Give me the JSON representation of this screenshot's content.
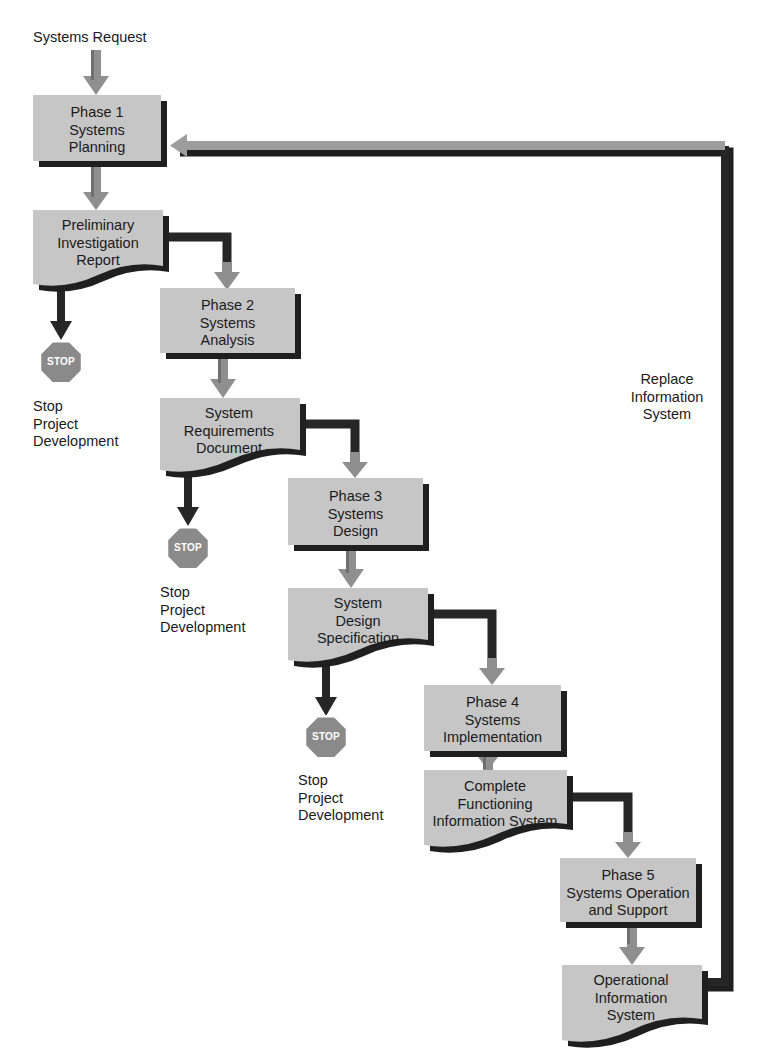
{
  "diagram": {
    "entry_label": "Systems Request",
    "feedback_label": "Replace\nInformation\nSystem",
    "colors": {
      "box_fill": "#c6c6c6",
      "box_fill_alt": "#c2c2c2",
      "shadow": "#1f1f1f",
      "arrow_gray": "#9a9a9a",
      "arrow_dark": "#262626",
      "text": "#1a1a1a",
      "stop_fill": "#8a8a8a",
      "stop_border": "#ffffff",
      "stop_text": "#ffffff",
      "background": "#ffffff"
    },
    "phases": [
      {
        "id": "phase1",
        "label": "Phase 1\nSystems\nPlanning",
        "shape": "rect",
        "x": 33,
        "y": 95,
        "w": 128,
        "h": 66
      },
      {
        "id": "phase2",
        "label": "Phase 2\nSystems\nAnalysis",
        "shape": "rect",
        "x": 160,
        "y": 288,
        "w": 135,
        "h": 65
      },
      {
        "id": "phase3",
        "label": "Phase 3\nSystems\nDesign",
        "shape": "rect",
        "x": 288,
        "y": 478,
        "w": 135,
        "h": 67
      },
      {
        "id": "phase4",
        "label": "Phase 4\nSystems\nImplementation",
        "shape": "rect",
        "x": 424,
        "y": 685,
        "w": 137,
        "h": 66
      },
      {
        "id": "phase5",
        "label": "Phase 5\nSystems Operation\nand Support",
        "shape": "rect",
        "x": 560,
        "y": 858,
        "w": 136,
        "h": 64
      }
    ],
    "documents": [
      {
        "id": "preliminary-investigation-report",
        "label": "Preliminary\nInvestigation\nReport",
        "shape": "document",
        "x": 33,
        "y": 210,
        "w": 130,
        "h": 78
      },
      {
        "id": "system-requirements-document",
        "label": "System\nRequirements\nDocument",
        "shape": "document",
        "x": 160,
        "y": 398,
        "w": 140,
        "h": 75
      },
      {
        "id": "system-design-specification",
        "label": "System\nDesign\nSpecification",
        "shape": "document",
        "x": 288,
        "y": 588,
        "w": 140,
        "h": 75
      },
      {
        "id": "complete-functioning-information-system",
        "label": "Complete\nFunctioning\nInformation System",
        "shape": "document",
        "x": 424,
        "y": 770,
        "w": 143,
        "h": 78
      },
      {
        "id": "operational-information-system",
        "label": "Operational\nInformation\nSystem",
        "shape": "document",
        "x": 562,
        "y": 965,
        "w": 140,
        "h": 78
      }
    ],
    "stops": [
      {
        "id": "stop-1",
        "badge": "STOP",
        "caption": "Stop\nProject\nDevelopment",
        "cx": 61,
        "cy": 358,
        "r": 21,
        "caption_x": 33,
        "caption_y": 398
      },
      {
        "id": "stop-2",
        "badge": "STOP",
        "caption": "Stop\nProject\nDevelopment",
        "cx": 188,
        "cy": 544,
        "r": 21,
        "caption_x": 160,
        "caption_y": 584
      },
      {
        "id": "stop-3",
        "badge": "STOP",
        "caption": "Stop\nProject\nDevelopment",
        "cx": 326,
        "cy": 733,
        "r": 21,
        "caption_x": 298,
        "caption_y": 772
      }
    ],
    "annotations": [
      {
        "id": "entry",
        "text": "Systems Request",
        "x": 33,
        "y": 29,
        "align": "left"
      },
      {
        "id": "feedback",
        "text": "Replace\nInformation\nSystem",
        "x": 635,
        "y": 371,
        "align": "center"
      }
    ]
  }
}
